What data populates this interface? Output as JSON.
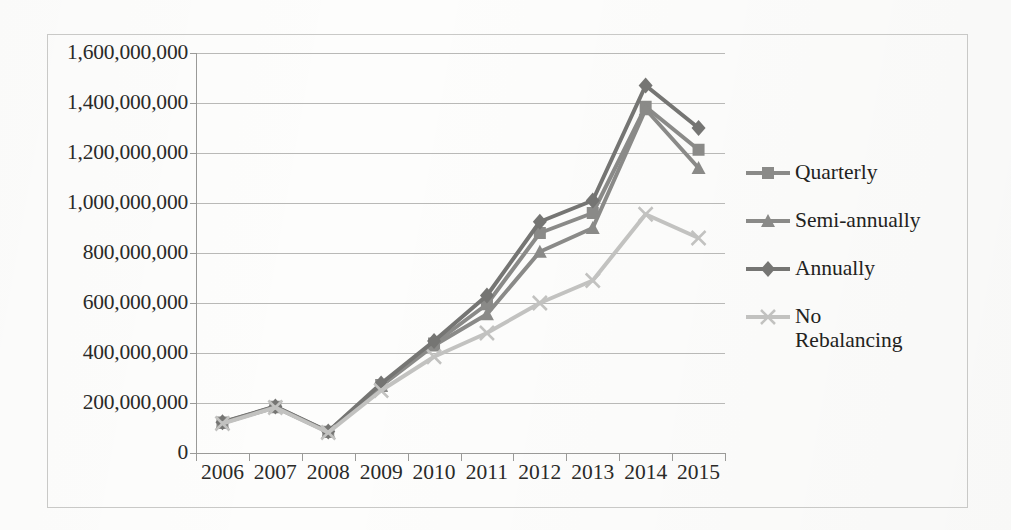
{
  "chart_data": {
    "type": "line",
    "title": "",
    "xlabel": "",
    "ylabel": "",
    "categories": [
      "2006",
      "2007",
      "2008",
      "2009",
      "2010",
      "2011",
      "2012",
      "2013",
      "2014",
      "2015"
    ],
    "x": [
      2006,
      2007,
      2008,
      2009,
      2010,
      2011,
      2012,
      2013,
      2014,
      2015
    ],
    "ylim": [
      0,
      1600000000
    ],
    "ytick_values": [
      0,
      200000000,
      400000000,
      600000000,
      800000000,
      1000000000,
      1200000000,
      1400000000,
      1600000000
    ],
    "ytick_labels": [
      "0",
      "200,000,000",
      "400,000,000",
      "600,000,000",
      "800,000,000",
      "1,000,000,000",
      "1,200,000,000",
      "1,400,000,000",
      "1,600,000,000"
    ],
    "grid": true,
    "legend_position": "right",
    "series": [
      {
        "name": "Quarterly",
        "marker": "square",
        "color": "#8a8a88",
        "values": [
          122000000,
          185000000,
          85000000,
          272000000,
          438000000,
          595000000,
          880000000,
          960000000,
          1385000000,
          1213000000
        ]
      },
      {
        "name": "Semi-annually",
        "marker": "triangle",
        "color": "#8a8a88",
        "values": [
          120000000,
          183000000,
          84000000,
          268000000,
          430000000,
          555000000,
          805000000,
          900000000,
          1375000000,
          1140000000
        ]
      },
      {
        "name": "Annually",
        "marker": "diamond",
        "color": "#757573",
        "values": [
          123000000,
          186000000,
          86000000,
          278000000,
          448000000,
          630000000,
          925000000,
          1010000000,
          1470000000,
          1300000000
        ]
      },
      {
        "name": "No\nRebalancing",
        "marker": "x",
        "color": "#c2c2c0",
        "values": [
          118000000,
          182000000,
          82000000,
          250000000,
          385000000,
          480000000,
          600000000,
          690000000,
          955000000,
          860000000
        ]
      }
    ]
  },
  "legend": {
    "items": [
      {
        "label": "Quarterly"
      },
      {
        "label": "Semi-annually"
      },
      {
        "label": "Annually"
      },
      {
        "label": "No\nRebalancing"
      }
    ]
  },
  "colors": {
    "axis": "#9a9a98",
    "grid": "#b9b9b7",
    "text": "#2a2a28",
    "frame": "#c9c9c7",
    "dark_series": "#757573",
    "mid_series": "#8a8a88",
    "light_series": "#c2c2c0"
  }
}
